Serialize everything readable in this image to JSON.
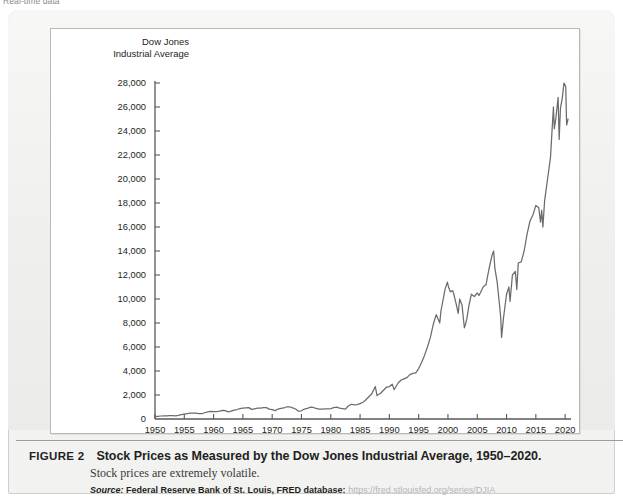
{
  "marginal_note": "Real-time data",
  "figure": {
    "label": "FIGURE 2",
    "title": "Stock Prices as Measured by the Dow Jones Industrial Average, 1950–2020.",
    "subtitle": "Stock prices are extremely volatile.",
    "source_word": "Source:",
    "source_body": "Federal Reserve Bank of St. Louis, FRED database:",
    "source_url": "https://fred.stlouisfed.org/series/DJIA"
  },
  "colors": {
    "panel": "#f2f2f1",
    "panel_border": "#cfcfcd",
    "chart_bg": "#ffffff",
    "chart_border": "#b9b9b7",
    "axis": "#58585a",
    "line": "#6b6b6d",
    "text": "#231f20",
    "url": "#b6b6b8",
    "rule": "#9c9c9a"
  },
  "chart_data": {
    "type": "line",
    "title": "Stock Prices as Measured by the Dow Jones Industrial Average, 1950–2020",
    "ylabel": "Dow Jones\nIndustrial Average",
    "xlabel": "",
    "grid": false,
    "legend": "none",
    "xlim": [
      1950,
      2021
    ],
    "ylim": [
      0,
      28000
    ],
    "xticks": [
      1950,
      1955,
      1960,
      1965,
      1970,
      1975,
      1980,
      1985,
      1990,
      1995,
      2000,
      2005,
      2010,
      2015,
      2020
    ],
    "xtick_labels": [
      "1950",
      "1955",
      "1960",
      "1965",
      "1970",
      "1975",
      "1980",
      "1985",
      "1990",
      "1995",
      "2000",
      "2005",
      "2010",
      "2015",
      "2020"
    ],
    "yticks": [
      0,
      2000,
      4000,
      6000,
      8000,
      10000,
      12000,
      14000,
      16000,
      18000,
      20000,
      22000,
      24000,
      26000,
      28000
    ],
    "ytick_labels": [
      "0",
      "2,000",
      "4,000",
      "6,000",
      "8,000",
      "10,000",
      "12,000",
      "14,000",
      "16,000",
      "18,000",
      "20,000",
      "22,000",
      "24,000",
      "26,000",
      "28,000"
    ],
    "series": [
      {
        "name": "Dow Jones Industrial Average",
        "x": [
          1950.0,
          1950.5,
          1951.0,
          1951.5,
          1952.0,
          1952.5,
          1953.0,
          1953.5,
          1954.0,
          1954.5,
          1955.0,
          1955.5,
          1956.0,
          1956.5,
          1957.0,
          1957.5,
          1958.0,
          1958.5,
          1959.0,
          1959.5,
          1960.0,
          1960.5,
          1961.0,
          1961.5,
          1962.0,
          1962.5,
          1963.0,
          1963.5,
          1964.0,
          1964.5,
          1965.0,
          1965.5,
          1966.0,
          1966.5,
          1967.0,
          1967.5,
          1968.0,
          1968.5,
          1969.0,
          1969.5,
          1970.0,
          1970.5,
          1971.0,
          1971.5,
          1972.0,
          1972.5,
          1973.0,
          1973.5,
          1974.0,
          1974.5,
          1975.0,
          1975.5,
          1976.0,
          1976.5,
          1977.0,
          1977.5,
          1978.0,
          1978.5,
          1979.0,
          1979.5,
          1980.0,
          1980.5,
          1981.0,
          1981.5,
          1982.0,
          1982.5,
          1983.0,
          1983.5,
          1984.0,
          1984.5,
          1985.0,
          1985.5,
          1986.0,
          1986.5,
          1987.0,
          1987.6,
          1987.9,
          1988.0,
          1988.5,
          1989.0,
          1989.5,
          1990.0,
          1990.5,
          1990.8,
          1991.0,
          1991.5,
          1992.0,
          1992.5,
          1993.0,
          1993.5,
          1994.0,
          1994.5,
          1995.0,
          1995.5,
          1996.0,
          1996.5,
          1997.0,
          1997.5,
          1998.0,
          1998.6,
          1998.8,
          1999.0,
          1999.5,
          1999.9,
          2000.1,
          2000.4,
          2000.8,
          2001.0,
          2001.4,
          2001.75,
          2002.0,
          2002.4,
          2002.8,
          2003.0,
          2003.2,
          2003.6,
          2004.0,
          2004.5,
          2005.0,
          2005.3,
          2005.8,
          2006.0,
          2006.5,
          2007.0,
          2007.5,
          2007.8,
          2008.0,
          2008.4,
          2008.8,
          2009.0,
          2009.15,
          2009.5,
          2010.0,
          2010.4,
          2010.6,
          2011.0,
          2011.5,
          2011.75,
          2012.0,
          2012.5,
          2013.0,
          2013.5,
          2014.0,
          2014.5,
          2015.0,
          2015.5,
          2015.8,
          2016.0,
          2016.2,
          2016.5,
          2017.0,
          2017.5,
          2018.0,
          2018.15,
          2018.4,
          2018.8,
          2018.98,
          2019.2,
          2019.5,
          2019.8,
          2020.1,
          2020.25,
          2020.5
        ],
        "y": [
          200,
          225,
          250,
          265,
          270,
          280,
          280,
          265,
          300,
          360,
          410,
          450,
          480,
          490,
          480,
          440,
          440,
          520,
          590,
          640,
          620,
          610,
          650,
          720,
          700,
          600,
          650,
          740,
          790,
          860,
          900,
          930,
          950,
          800,
          850,
          900,
          900,
          950,
          950,
          820,
          780,
          700,
          830,
          880,
          920,
          1020,
          1020,
          930,
          830,
          650,
          680,
          830,
          880,
          980,
          960,
          880,
          820,
          820,
          840,
          850,
          870,
          940,
          990,
          900,
          860,
          820,
          1080,
          1230,
          1180,
          1200,
          1280,
          1400,
          1600,
          1850,
          2100,
          2700,
          1950,
          2000,
          2150,
          2400,
          2650,
          2700,
          2900,
          2450,
          2600,
          3000,
          3250,
          3350,
          3450,
          3700,
          3800,
          3850,
          4200,
          4700,
          5300,
          6000,
          6800,
          7900,
          8700,
          8000,
          9000,
          9500,
          10800,
          11400,
          11000,
          10600,
          10700,
          10400,
          9600,
          8800,
          10000,
          9500,
          7600,
          7900,
          8300,
          9500,
          10400,
          10200,
          10500,
          10300,
          10800,
          11000,
          11200,
          12500,
          13600,
          14000,
          12600,
          11400,
          9500,
          8500,
          6800,
          8500,
          10400,
          11000,
          9800,
          12000,
          12300,
          10800,
          13000,
          13100,
          14000,
          15400,
          16500,
          17000,
          17800,
          17600,
          16400,
          17400,
          16000,
          18200,
          20000,
          21800,
          26000,
          24200,
          25000,
          26800,
          23300,
          25900,
          26700,
          28000,
          27700,
          24500,
          25000
        ]
      }
    ],
    "annotations": []
  }
}
